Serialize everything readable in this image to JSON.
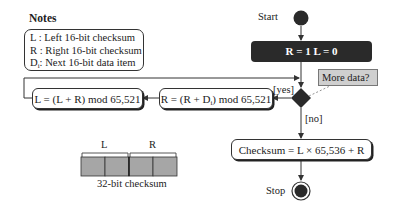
{
  "notes": {
    "title": "Notes",
    "items": [
      {
        "symbol": "L",
        "text": " : Left 16-bit checksum"
      },
      {
        "symbol": "R",
        "text": " : Right 16-bit checksum"
      },
      {
        "symbol": "D",
        "subscript": "i",
        "text": ": Next 16-bit data item"
      }
    ]
  },
  "flow": {
    "start_label": "Start",
    "init_label": "R = 1   L = 0",
    "decision_note": "More data?",
    "yes_label": "[yes]",
    "no_label": "[no]",
    "r_update": {
      "prefix": "R = (R + D",
      "sub": "i",
      "suffix": ") mod 65,521"
    },
    "l_update": "L = (L + R) mod 65,521",
    "checksum": "Checksum = L × 65,536 + R",
    "stop_label": "Stop"
  },
  "checksum_layout": {
    "left_label": "L",
    "right_label": "R",
    "caption": "32-bit checksum",
    "cell_count": 4,
    "cell_color": "#a6a6a6"
  },
  "colors": {
    "node_fill": "#2a2a2a",
    "note_fill": "#cfcfcf",
    "line": "#333333"
  }
}
